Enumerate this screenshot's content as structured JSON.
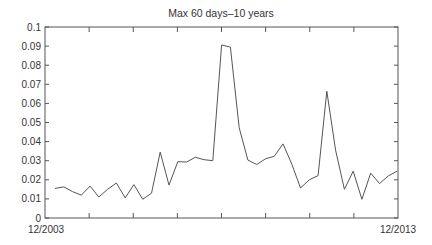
{
  "chart_data": {
    "type": "line",
    "title": "Max 60 days–10 years",
    "xlabel": "",
    "ylabel": "",
    "ylim": [
      0,
      0.1
    ],
    "yticks": [
      0,
      0.01,
      0.02,
      0.03,
      0.04,
      0.05,
      0.06,
      0.07,
      0.08,
      0.09,
      0.1
    ],
    "ytick_labels": [
      "0",
      "0.01",
      "0.02",
      "0.03",
      "0.04",
      "0.05",
      "0.06",
      "0.07",
      "0.08",
      "0.09",
      "0.1"
    ],
    "x_start_label": "12/2003",
    "x_end_label": "12/2013",
    "grid": false,
    "legend": null,
    "series": [
      {
        "name": "Max 60 days–10 years",
        "color": "#555555",
        "values": [
          0.0155,
          0.0163,
          0.0138,
          0.012,
          0.0167,
          0.011,
          0.015,
          0.0183,
          0.0105,
          0.0175,
          0.0098,
          0.013,
          0.0345,
          0.0172,
          0.0295,
          0.0293,
          0.0318,
          0.0305,
          0.03,
          0.0906,
          0.0895,
          0.0472,
          0.0303,
          0.028,
          0.031,
          0.0323,
          0.0388,
          0.0282,
          0.0157,
          0.02,
          0.0222,
          0.0664,
          0.0355,
          0.015,
          0.0245,
          0.0098,
          0.0235,
          0.018,
          0.022,
          0.0245
        ]
      }
    ]
  }
}
